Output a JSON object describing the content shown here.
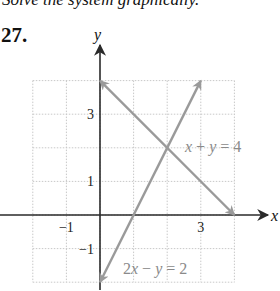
{
  "header": {
    "instruction": "Solve the system graphically.",
    "problem_number": "27."
  },
  "chart_data": {
    "type": "line",
    "title": "",
    "xlabel": "x",
    "ylabel": "y",
    "xlim": [
      -2,
      4
    ],
    "ylim": [
      -2,
      4
    ],
    "grid": true,
    "x_tick_labels": [
      {
        "value": -1,
        "label": "−1"
      },
      {
        "value": 3,
        "label": "3"
      }
    ],
    "y_tick_labels": [
      {
        "value": 3,
        "label": "3"
      },
      {
        "value": 1,
        "label": "1"
      },
      {
        "value": -1,
        "label": "−1"
      }
    ],
    "series": [
      {
        "name": "x + y = 4",
        "points": [
          [
            0,
            4
          ],
          [
            4,
            0
          ]
        ],
        "color": "#9a9a9a",
        "arrows": "both"
      },
      {
        "name": "2x − y = 2",
        "points": [
          [
            0,
            -2
          ],
          [
            3,
            4
          ]
        ],
        "color": "#9a9a9a",
        "arrows": "both"
      }
    ],
    "intersection": [
      2,
      2
    ],
    "annotations": [
      {
        "text": "x + y = 4",
        "near": [
          2.5,
          2
        ]
      },
      {
        "text": "2x − y = 2",
        "near": [
          0.7,
          -1.7
        ]
      }
    ]
  },
  "colors": {
    "axis": "#2a2a2a",
    "grid": "#c8c8c8",
    "lines": "#9a9a9a",
    "labels": "#8a8a8a"
  }
}
